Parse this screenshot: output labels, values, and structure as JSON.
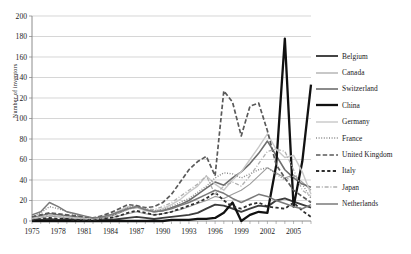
{
  "chart_data": {
    "type": "line",
    "title": "",
    "xlabel": "",
    "ylabel": "Number of inventors",
    "xlim": [
      1975,
      2007
    ],
    "ylim": [
      0,
      200
    ],
    "ytick_step": 20,
    "yticks": [
      "0",
      "20",
      "40",
      "60",
      "80",
      "100",
      "120",
      "140",
      "160",
      "180",
      "200"
    ],
    "xticks": [
      "1975",
      "1978",
      "1981",
      "1984",
      "1987",
      "1990",
      "1993",
      "1996",
      "1999",
      "2002",
      "2005"
    ],
    "xtick_values": [
      1975,
      1978,
      1981,
      1984,
      1987,
      1990,
      1993,
      1996,
      1999,
      2002,
      2005
    ],
    "x": [
      1975,
      1976,
      1977,
      1978,
      1979,
      1980,
      1981,
      1982,
      1983,
      1984,
      1985,
      1986,
      1987,
      1988,
      1989,
      1990,
      1991,
      1992,
      1993,
      1994,
      1995,
      1996,
      1997,
      1998,
      1999,
      2000,
      2001,
      2002,
      2003,
      2004,
      2005,
      2006,
      2007
    ],
    "grid": "horizontal",
    "legend_position": "right",
    "series": [
      {
        "name": "Belgium",
        "color": "#3c3c3c",
        "width": 1.9,
        "dash": "none",
        "values": [
          1,
          1,
          2,
          1,
          2,
          1,
          1,
          0,
          1,
          1,
          2,
          3,
          4,
          3,
          2,
          3,
          4,
          5,
          6,
          8,
          12,
          16,
          15,
          12,
          9,
          12,
          15,
          14,
          20,
          22,
          19,
          16,
          13
        ]
      },
      {
        "name": "Canada",
        "color": "#9c9c9c",
        "width": 1.1,
        "dash": "none",
        "values": [
          2,
          3,
          5,
          4,
          3,
          2,
          2,
          1,
          2,
          3,
          5,
          7,
          9,
          7,
          6,
          7,
          9,
          11,
          14,
          17,
          20,
          24,
          22,
          26,
          30,
          36,
          44,
          52,
          47,
          42,
          45,
          38,
          30
        ]
      },
      {
        "name": "Switzerland",
        "color": "#6e6e6e",
        "width": 1.6,
        "dash": "none",
        "values": [
          3,
          5,
          7,
          6,
          5,
          4,
          3,
          2,
          3,
          5,
          8,
          12,
          14,
          11,
          9,
          10,
          13,
          16,
          20,
          26,
          32,
          38,
          35,
          42,
          48,
          56,
          66,
          78,
          64,
          50,
          42,
          36,
          33
        ]
      },
      {
        "name": "China",
        "color": "#111111",
        "width": 2.3,
        "dash": "none",
        "values": [
          0,
          0,
          0,
          0,
          0,
          0,
          0,
          0,
          0,
          0,
          0,
          0,
          0,
          0,
          0,
          0,
          1,
          1,
          1,
          2,
          2,
          3,
          8,
          18,
          0,
          6,
          9,
          8,
          54,
          178,
          14,
          58,
          133
        ]
      },
      {
        "name": "Germany",
        "color": "#c8c8c8",
        "width": 1.4,
        "dash": "none",
        "values": [
          3,
          4,
          6,
          5,
          4,
          3,
          3,
          2,
          3,
          6,
          10,
          14,
          13,
          10,
          9,
          12,
          16,
          21,
          28,
          34,
          44,
          36,
          30,
          40,
          48,
          60,
          72,
          85,
          70,
          62,
          64,
          48,
          26
        ]
      },
      {
        "name": "France",
        "color": "#8a8a8a",
        "width": 1.4,
        "dash": "dotted",
        "values": [
          4,
          8,
          14,
          12,
          9,
          6,
          4,
          3,
          4,
          6,
          9,
          13,
          15,
          12,
          10,
          11,
          14,
          18,
          22,
          28,
          34,
          42,
          47,
          46,
          42,
          46,
          50,
          52,
          46,
          40,
          44,
          36,
          22
        ]
      },
      {
        "name": "United Kingdom",
        "color": "#5a5a5a",
        "width": 1.7,
        "dash": "dashed-long",
        "values": [
          4,
          6,
          8,
          7,
          6,
          5,
          4,
          3,
          5,
          8,
          12,
          16,
          15,
          13,
          14,
          18,
          26,
          38,
          50,
          58,
          63,
          44,
          127,
          116,
          83,
          112,
          115,
          88,
          55,
          42,
          30,
          24,
          18
        ]
      },
      {
        "name": "Italy",
        "color": "#2e2e2e",
        "width": 1.8,
        "dash": "dashed-medium",
        "values": [
          1,
          2,
          3,
          2,
          2,
          1,
          1,
          1,
          2,
          3,
          5,
          8,
          10,
          8,
          6,
          7,
          9,
          12,
          15,
          18,
          22,
          28,
          20,
          14,
          12,
          16,
          18,
          14,
          13,
          12,
          18,
          10,
          4
        ]
      },
      {
        "name": "Japan",
        "color": "#b0b0b0",
        "width": 1.3,
        "dash": "dash-dot",
        "values": [
          2,
          4,
          6,
          5,
          4,
          3,
          2,
          2,
          3,
          5,
          8,
          11,
          13,
          12,
          11,
          14,
          18,
          24,
          30,
          36,
          44,
          26,
          34,
          38,
          34,
          44,
          56,
          68,
          70,
          68,
          50,
          30,
          24
        ]
      },
      {
        "name": "Netherlands",
        "color": "#7a7a7a",
        "width": 1.5,
        "dash": "none",
        "values": [
          6,
          9,
          18,
          14,
          9,
          7,
          5,
          3,
          4,
          6,
          9,
          12,
          14,
          11,
          9,
          10,
          12,
          15,
          18,
          22,
          26,
          30,
          27,
          22,
          18,
          22,
          26,
          24,
          20,
          17,
          14,
          12,
          16
        ]
      }
    ]
  }
}
